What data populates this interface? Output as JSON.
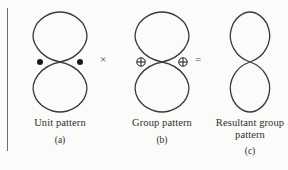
{
  "figure": {
    "background_color": "#fbfbf9",
    "stroke_color": "#3a3a3a",
    "rule_color": "#6d6d6d"
  },
  "operators": {
    "multiply": "×",
    "equals": "="
  },
  "panels": [
    {
      "id": "a",
      "caption": "Unit pattern",
      "sublabel": "(a)",
      "pattern": "figure-eight",
      "marker_symbol": "●",
      "marker_name": "filled-dot",
      "marker_count": 2
    },
    {
      "id": "b",
      "caption": "Group pattern",
      "sublabel": "(b)",
      "pattern": "figure-eight",
      "marker_symbol": "⊕",
      "marker_name": "circled-plus",
      "marker_count": 2
    },
    {
      "id": "c",
      "caption": "Resultant group pattern",
      "caption_line1": "Resultant group",
      "caption_line2": "pattern",
      "sublabel": "(c)",
      "pattern": "figure-eight-narrow",
      "marker_symbol": "",
      "marker_name": "none",
      "marker_count": 0
    }
  ]
}
